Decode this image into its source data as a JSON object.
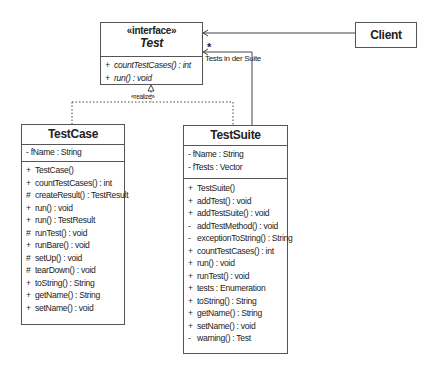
{
  "diagram": {
    "interface": {
      "stereotype": "«interface»",
      "name": "Test",
      "methods": [
        {
          "vis": "+",
          "text": "countTestCases() : int"
        },
        {
          "vis": "+",
          "text": "run() : void"
        }
      ]
    },
    "client": {
      "name": "Client"
    },
    "testcase": {
      "name": "TestCase",
      "attributes": [
        {
          "vis": "-",
          "text": "fName : String"
        }
      ],
      "methods": [
        {
          "vis": "+",
          "text": "TestCase()"
        },
        {
          "vis": "+",
          "text": "countTestCases() : int"
        },
        {
          "vis": "#",
          "text": "createResult() : TestResult"
        },
        {
          "vis": "+",
          "text": "run() : void"
        },
        {
          "vis": "+",
          "text": "run() : TestResult"
        },
        {
          "vis": "#",
          "text": "runTest() : void"
        },
        {
          "vis": "+",
          "text": "runBare() : void"
        },
        {
          "vis": "#",
          "text": "setUp() : void"
        },
        {
          "vis": "#",
          "text": "tearDown() : void"
        },
        {
          "vis": "+",
          "text": "toString() : String"
        },
        {
          "vis": "+",
          "text": "getName() : String"
        },
        {
          "vis": "+",
          "text": "setName() : void"
        }
      ]
    },
    "testsuite": {
      "name": "TestSuite",
      "attributes": [
        {
          "vis": "-",
          "text": "fName : String"
        },
        {
          "vis": "-",
          "text": "fTests : Vector"
        }
      ],
      "methods": [
        {
          "vis": "+",
          "text": "TestSuite()"
        },
        {
          "vis": "+",
          "text": "addTest() : void"
        },
        {
          "vis": "+",
          "text": "addTestSuite() : void"
        },
        {
          "vis": "-",
          "text": "addTestMethod() : void"
        },
        {
          "vis": "-",
          "text": "exceptionToString() : String"
        },
        {
          "vis": "+",
          "text": "countTestCases() : int"
        },
        {
          "vis": "+",
          "text": "run() : void"
        },
        {
          "vis": "+",
          "text": "runTest() : void"
        },
        {
          "vis": "+",
          "text": "tests : Enumeration"
        },
        {
          "vis": "+",
          "text": "toString() : String"
        },
        {
          "vis": "+",
          "text": "getName() : String"
        },
        {
          "vis": "+",
          "text": "setName() : void"
        },
        {
          "vis": "-",
          "text": "warning() : Test"
        }
      ]
    },
    "labels": {
      "realize": "«realize»",
      "multiplicity": "*",
      "association": "Tests in der Suite"
    }
  }
}
